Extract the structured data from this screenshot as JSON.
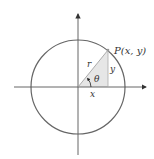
{
  "diagram": {
    "type": "unit-circle-trig",
    "labels": {
      "point": "P(x, y)",
      "radius": "r",
      "angle": "θ",
      "opposite": "y",
      "adjacent": "x"
    },
    "colors": {
      "stroke": "#555555",
      "circle": "#666666",
      "triangle_fill": "#e6e6e6",
      "text": "#333333"
    }
  }
}
